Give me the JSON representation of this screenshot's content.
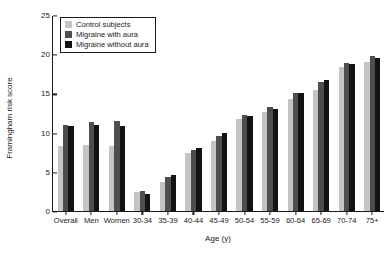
{
  "chart_data": {
    "type": "bar",
    "title": "",
    "xlabel": "Age (y)",
    "ylabel": "Framingham risk score",
    "ylim": [
      0,
      25
    ],
    "yticks": [
      0,
      5,
      10,
      15,
      20,
      25
    ],
    "grid": false,
    "legend_position": "top-left",
    "categories": [
      "Overall",
      "Men",
      "Women",
      "30-34",
      "35-39",
      "40-44",
      "45-49",
      "50-54",
      "55-59",
      "60-64",
      "65-69",
      "70-74",
      "75+"
    ],
    "series": [
      {
        "name": "Control subjects",
        "color": "#c4c4c4",
        "values": [
          8.3,
          8.4,
          8.3,
          2.4,
          3.7,
          7.4,
          8.9,
          11.8,
          12.6,
          14.3,
          15.4,
          18.4,
          19.0
        ]
      },
      {
        "name": "Migraine with aura",
        "color": "#4e4e4e",
        "values": [
          11.0,
          11.4,
          11.5,
          2.5,
          4.3,
          7.8,
          9.6,
          12.2,
          13.3,
          15.0,
          16.4,
          18.9,
          19.8
        ]
      },
      {
        "name": "Migraine without aura",
        "color": "#131313",
        "values": [
          10.9,
          11.0,
          10.9,
          2.2,
          4.6,
          8.0,
          9.9,
          12.1,
          13.0,
          15.0,
          16.7,
          18.7,
          19.5
        ]
      }
    ]
  },
  "legend": {
    "items": [
      {
        "label": "Control subjects"
      },
      {
        "label": "Migraine with aura"
      },
      {
        "label": "Migraine without aura"
      }
    ]
  }
}
